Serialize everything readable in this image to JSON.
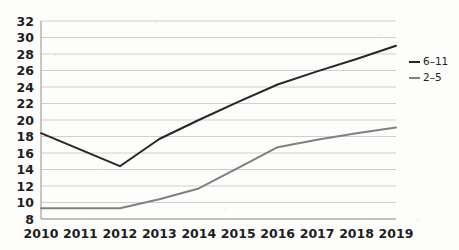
{
  "chart_data": {
    "type": "line",
    "title": "",
    "subtitle": "",
    "xlabel": "",
    "ylabel": "",
    "x": [
      2010,
      2011,
      2012,
      2013,
      2014,
      2015,
      2016,
      2017,
      2018,
      2019
    ],
    "categories": [
      "2010",
      "2011",
      "2012",
      "2013",
      "2014",
      "2015",
      "2016",
      "2017",
      "2018",
      "2019"
    ],
    "series": [
      {
        "name": "6–11",
        "color": "#262626",
        "values": [
          18.4,
          16.4,
          14.4,
          17.7,
          20.0,
          22.2,
          24.3,
          25.9,
          27.4,
          29.0
        ]
      },
      {
        "name": "2–5",
        "color": "#808080",
        "values": [
          9.3,
          9.3,
          9.3,
          10.4,
          11.7,
          14.2,
          16.7,
          17.6,
          18.4,
          19.1
        ]
      }
    ],
    "ylim": [
      8,
      32
    ],
    "ytick_step": 2,
    "yticks": [
      "32",
      "30",
      "28",
      "26",
      "24",
      "22",
      "20",
      "18",
      "16",
      "14",
      "12",
      "10",
      "8"
    ],
    "xticks": [
      "2010",
      "2011",
      "2012",
      "2013",
      "2014",
      "2015",
      "2016",
      "2017",
      "2018",
      "2019"
    ],
    "grid": "horizontal",
    "legend_position": "right",
    "legend": [
      {
        "label": "6–11",
        "color": "#262626"
      },
      {
        "label": "2–5",
        "color": "#808080"
      }
    ]
  }
}
